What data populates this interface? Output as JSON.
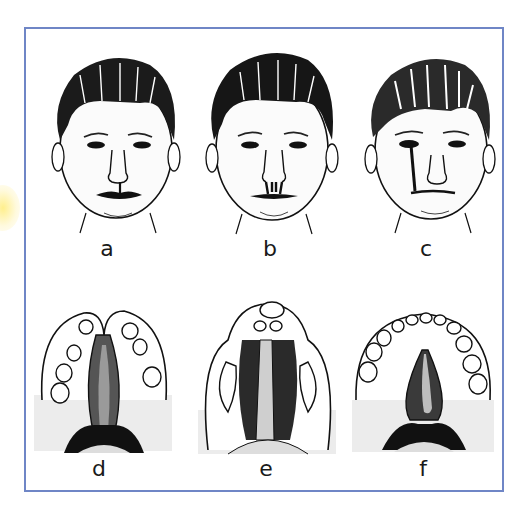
{
  "figure": {
    "frame_color": "#6f86c6",
    "accent_glow_color": "#ffec78",
    "panels": [
      {
        "id": "a",
        "label": "a",
        "kind": "face",
        "condition": "unilateral incomplete cleft lip"
      },
      {
        "id": "b",
        "label": "b",
        "kind": "face",
        "condition": "bilateral cleft lip"
      },
      {
        "id": "c",
        "label": "c",
        "kind": "face",
        "condition": "oblique facial cleft"
      },
      {
        "id": "d",
        "label": "d",
        "kind": "palate",
        "condition": "cleft palate with alveolar cleft"
      },
      {
        "id": "e",
        "label": "e",
        "kind": "palate",
        "condition": "bilateral complete cleft palate"
      },
      {
        "id": "f",
        "label": "f",
        "kind": "palate",
        "condition": "isolated cleft of secondary palate"
      }
    ]
  }
}
